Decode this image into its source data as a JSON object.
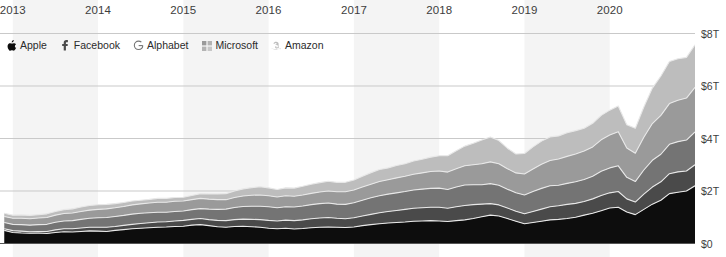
{
  "chart_data": {
    "type": "area",
    "stacked": true,
    "title": "",
    "subtitle": "",
    "xlabel": "",
    "ylabel": "",
    "xlim": [
      2012.85,
      2021.0
    ],
    "ylim": [
      0,
      8
    ],
    "y_unit": "trillions of USD",
    "grid": true,
    "grid_axis": "y",
    "legend_position": "top-left",
    "x_tick_labels": [
      "2013",
      "2014",
      "2015",
      "2016",
      "2017",
      "2018",
      "2019",
      "2020"
    ],
    "x_tick_values": [
      2013,
      2014,
      2015,
      2016,
      2017,
      2018,
      2019,
      2020
    ],
    "y_tick_labels": [
      "$0",
      "$2T",
      "$4T",
      "$6T",
      "$8T"
    ],
    "y_tick_values": [
      0,
      2,
      4,
      6,
      8
    ],
    "x": [
      2012.9,
      2013.0,
      2013.1,
      2013.2,
      2013.3,
      2013.4,
      2013.5,
      2013.6,
      2013.7,
      2013.8,
      2013.9,
      2014.0,
      2014.1,
      2014.2,
      2014.3,
      2014.4,
      2014.5,
      2014.6,
      2014.7,
      2014.8,
      2014.9,
      2015.0,
      2015.1,
      2015.2,
      2015.3,
      2015.4,
      2015.5,
      2015.6,
      2015.7,
      2015.8,
      2015.9,
      2016.0,
      2016.1,
      2016.2,
      2016.3,
      2016.4,
      2016.5,
      2016.6,
      2016.7,
      2016.8,
      2016.9,
      2017.0,
      2017.1,
      2017.2,
      2017.3,
      2017.4,
      2017.5,
      2017.6,
      2017.7,
      2017.8,
      2017.9,
      2018.0,
      2018.1,
      2018.2,
      2018.3,
      2018.4,
      2018.5,
      2018.6,
      2018.7,
      2018.8,
      2018.9,
      2019.0,
      2019.1,
      2019.2,
      2019.3,
      2019.4,
      2019.5,
      2019.6,
      2019.7,
      2019.8,
      2019.9,
      2020.0,
      2020.1,
      2020.2,
      2020.3,
      2020.4,
      2020.5,
      2020.6,
      2020.7,
      2020.8,
      2020.9,
      2021.0
    ],
    "series": [
      {
        "name": "Apple",
        "color": "#0d0d0d",
        "values": [
          0.5,
          0.42,
          0.4,
          0.39,
          0.4,
          0.38,
          0.42,
          0.45,
          0.44,
          0.46,
          0.48,
          0.47,
          0.46,
          0.5,
          0.53,
          0.56,
          0.58,
          0.6,
          0.62,
          0.63,
          0.65,
          0.66,
          0.7,
          0.72,
          0.68,
          0.64,
          0.62,
          0.65,
          0.66,
          0.64,
          0.62,
          0.58,
          0.56,
          0.58,
          0.55,
          0.57,
          0.6,
          0.62,
          0.63,
          0.62,
          0.61,
          0.63,
          0.68,
          0.72,
          0.75,
          0.78,
          0.8,
          0.82,
          0.85,
          0.86,
          0.87,
          0.86,
          0.84,
          0.87,
          0.9,
          0.95,
          1.02,
          1.08,
          1.05,
          0.95,
          0.85,
          0.75,
          0.8,
          0.85,
          0.9,
          0.92,
          0.95,
          1.0,
          1.08,
          1.15,
          1.25,
          1.35,
          1.38,
          1.2,
          1.1,
          1.3,
          1.5,
          1.65,
          1.9,
          1.95,
          2.0,
          2.2
        ]
      },
      {
        "name": "Facebook",
        "color": "#4a4a4a",
        "values": [
          0.06,
          0.07,
          0.07,
          0.06,
          0.06,
          0.08,
          0.1,
          0.11,
          0.12,
          0.13,
          0.14,
          0.15,
          0.16,
          0.15,
          0.16,
          0.17,
          0.18,
          0.19,
          0.2,
          0.2,
          0.21,
          0.22,
          0.22,
          0.23,
          0.23,
          0.24,
          0.25,
          0.26,
          0.27,
          0.28,
          0.29,
          0.3,
          0.3,
          0.31,
          0.32,
          0.33,
          0.34,
          0.35,
          0.36,
          0.34,
          0.33,
          0.35,
          0.37,
          0.39,
          0.42,
          0.44,
          0.46,
          0.48,
          0.49,
          0.5,
          0.51,
          0.52,
          0.5,
          0.53,
          0.55,
          0.53,
          0.48,
          0.44,
          0.42,
          0.4,
          0.38,
          0.38,
          0.42,
          0.46,
          0.5,
          0.52,
          0.54,
          0.53,
          0.52,
          0.55,
          0.58,
          0.58,
          0.6,
          0.5,
          0.48,
          0.58,
          0.65,
          0.7,
          0.76,
          0.78,
          0.76,
          0.8
        ]
      },
      {
        "name": "Alphabet",
        "color": "#747474",
        "values": [
          0.24,
          0.24,
          0.25,
          0.25,
          0.26,
          0.27,
          0.29,
          0.3,
          0.31,
          0.33,
          0.34,
          0.36,
          0.37,
          0.38,
          0.38,
          0.39,
          0.39,
          0.38,
          0.37,
          0.36,
          0.36,
          0.36,
          0.37,
          0.38,
          0.4,
          0.42,
          0.44,
          0.46,
          0.48,
          0.5,
          0.51,
          0.52,
          0.5,
          0.51,
          0.52,
          0.53,
          0.54,
          0.55,
          0.55,
          0.54,
          0.55,
          0.57,
          0.6,
          0.63,
          0.65,
          0.66,
          0.67,
          0.68,
          0.7,
          0.71,
          0.72,
          0.73,
          0.72,
          0.75,
          0.78,
          0.76,
          0.74,
          0.76,
          0.75,
          0.72,
          0.7,
          0.72,
          0.76,
          0.79,
          0.8,
          0.78,
          0.8,
          0.82,
          0.84,
          0.86,
          0.92,
          0.95,
          0.98,
          0.82,
          0.78,
          0.92,
          1.02,
          1.05,
          1.12,
          1.15,
          1.18,
          1.25
        ]
      },
      {
        "name": "Microsoft",
        "color": "#9a9a9a",
        "values": [
          0.23,
          0.23,
          0.24,
          0.24,
          0.25,
          0.26,
          0.27,
          0.28,
          0.29,
          0.3,
          0.31,
          0.32,
          0.33,
          0.33,
          0.34,
          0.35,
          0.36,
          0.37,
          0.38,
          0.38,
          0.39,
          0.38,
          0.38,
          0.39,
          0.38,
          0.37,
          0.36,
          0.38,
          0.4,
          0.42,
          0.43,
          0.42,
          0.41,
          0.42,
          0.41,
          0.42,
          0.43,
          0.44,
          0.46,
          0.47,
          0.48,
          0.49,
          0.5,
          0.52,
          0.54,
          0.55,
          0.57,
          0.58,
          0.6,
          0.62,
          0.64,
          0.65,
          0.66,
          0.7,
          0.73,
          0.76,
          0.8,
          0.83,
          0.82,
          0.78,
          0.76,
          0.8,
          0.86,
          0.92,
          0.96,
          1.0,
          1.03,
          1.06,
          1.08,
          1.12,
          1.2,
          1.25,
          1.3,
          1.12,
          1.08,
          1.25,
          1.4,
          1.48,
          1.55,
          1.58,
          1.6,
          1.7
        ]
      },
      {
        "name": "Amazon",
        "color": "#bdbdbd",
        "values": [
          0.12,
          0.12,
          0.13,
          0.13,
          0.13,
          0.14,
          0.14,
          0.15,
          0.16,
          0.17,
          0.18,
          0.18,
          0.17,
          0.16,
          0.15,
          0.15,
          0.14,
          0.14,
          0.15,
          0.15,
          0.14,
          0.14,
          0.16,
          0.18,
          0.2,
          0.22,
          0.23,
          0.25,
          0.27,
          0.29,
          0.31,
          0.3,
          0.29,
          0.3,
          0.31,
          0.33,
          0.35,
          0.36,
          0.37,
          0.36,
          0.36,
          0.38,
          0.41,
          0.44,
          0.46,
          0.45,
          0.47,
          0.48,
          0.5,
          0.52,
          0.55,
          0.58,
          0.62,
          0.68,
          0.75,
          0.82,
          0.9,
          0.95,
          0.88,
          0.78,
          0.72,
          0.78,
          0.84,
          0.88,
          0.9,
          0.88,
          0.9,
          0.89,
          0.87,
          0.9,
          0.93,
          0.95,
          0.98,
          0.88,
          0.95,
          1.15,
          1.35,
          1.5,
          1.6,
          1.58,
          1.55,
          1.62
        ]
      }
    ],
    "band_shading": {
      "color": "#f4f4f4",
      "spans": [
        [
          2013.0,
          2014.0
        ],
        [
          2015.0,
          2016.0
        ],
        [
          2017.0,
          2018.0
        ],
        [
          2019.0,
          2020.0
        ]
      ]
    },
    "gridline_color": "#c9c9c9",
    "baseline_color": "#555555",
    "separator_color": "#e8e8e8"
  },
  "legend": {
    "items": [
      {
        "label": "Apple",
        "icon": "apple-icon",
        "color": "#0d0d0d"
      },
      {
        "label": "Facebook",
        "icon": "facebook-icon",
        "color": "#4a4a4a"
      },
      {
        "label": "Alphabet",
        "icon": "alphabet-icon",
        "color": "#747474"
      },
      {
        "label": "Microsoft",
        "icon": "microsoft-icon",
        "color": "#9a9a9a"
      },
      {
        "label": "Amazon",
        "icon": "amazon-icon",
        "color": "#bdbdbd"
      }
    ]
  }
}
